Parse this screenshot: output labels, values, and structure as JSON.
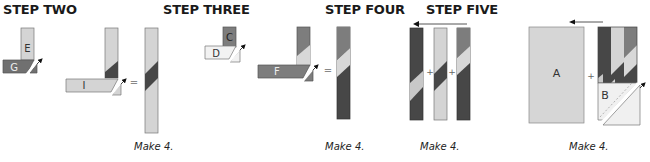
{
  "colors": {
    "light": "#d4d4d4",
    "medium": "#7d7d7d",
    "dark": "#474747",
    "outline": "#6a6a6a",
    "white": "#ffffff",
    "text": "#1a1a1a"
  },
  "steps": [
    {
      "title": "STEP TWO",
      "pieces": [
        "E",
        "G",
        "I"
      ],
      "operators": [
        "="
      ],
      "make_label": "Make 4."
    },
    {
      "title": "STEP THREE",
      "pieces": [
        "C",
        "D",
        "F"
      ],
      "operators": [
        "="
      ],
      "make_label": "Make 4."
    },
    {
      "title": "STEP FOUR",
      "pieces": [],
      "operators": [
        "+",
        "+"
      ],
      "make_label": "Make 4."
    },
    {
      "title": "STEP FIVE",
      "pieces": [
        "A",
        "B"
      ],
      "operators": [
        "+"
      ],
      "make_label": "Make 4."
    }
  ]
}
